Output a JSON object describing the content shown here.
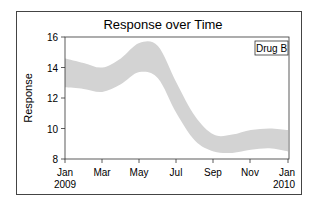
{
  "chart_data": {
    "type": "area",
    "title": "Response over Time",
    "xlabel": "",
    "ylabel": "Response",
    "ylim": [
      8,
      16
    ],
    "yticks": [
      8,
      10,
      12,
      14,
      16
    ],
    "xticks": [
      {
        "label": "Jan",
        "sub": "2009"
      },
      {
        "label": "Mar",
        "sub": ""
      },
      {
        "label": "May",
        "sub": ""
      },
      {
        "label": "Jul",
        "sub": ""
      },
      {
        "label": "Sep",
        "sub": ""
      },
      {
        "label": "Nov",
        "sub": ""
      },
      {
        "label": "Jan",
        "sub": "2010"
      }
    ],
    "grid": false,
    "legend": {
      "position": "top-right",
      "entries": [
        "Drug B"
      ]
    },
    "series": [
      {
        "name": "Drug B",
        "style": "confidence band",
        "color": "#d3d3d3",
        "x_month": [
          0,
          1,
          2,
          3,
          4,
          5,
          6,
          7,
          8,
          9,
          10,
          11,
          12
        ],
        "upper": [
          14.6,
          14.3,
          14.0,
          14.6,
          15.6,
          15.4,
          13.0,
          10.8,
          9.6,
          9.6,
          9.9,
          10.0,
          9.9
        ],
        "lower": [
          12.7,
          12.6,
          12.4,
          12.9,
          13.7,
          13.3,
          11.0,
          9.2,
          8.5,
          8.4,
          8.6,
          8.7,
          8.5
        ]
      }
    ]
  },
  "title": "Response over Time",
  "ylabel": "Response",
  "legend_label": "Drug B",
  "ytick_labels": [
    "16",
    "14",
    "12",
    "10",
    "8"
  ],
  "xtick_labels": [
    "Jan",
    "Mar",
    "May",
    "Jul",
    "Sep",
    "Nov",
    "Jan"
  ],
  "xtick_years": [
    "2009",
    "2010"
  ]
}
